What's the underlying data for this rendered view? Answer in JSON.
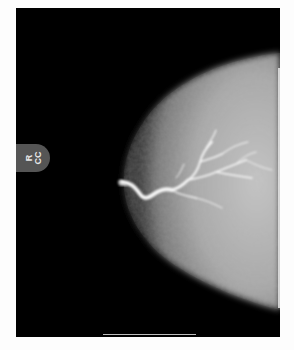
{
  "image": {
    "description": "Mammogram (galactogram) of right breast, craniocaudal view, showing contrast-filled branching ductal system from the nipple",
    "view_label": {
      "side": "R",
      "view": "CC"
    },
    "colors": {
      "background": "#000000",
      "label_tab": "#555555",
      "tissue_bright": "#bfbfbf",
      "contrast_duct": "#ffffff",
      "page": "#fdfdfd"
    }
  }
}
